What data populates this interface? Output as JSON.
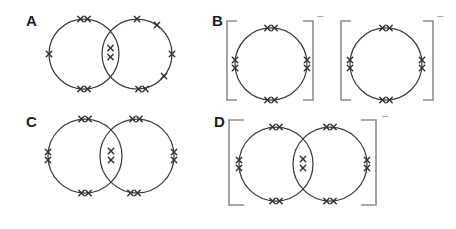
{
  "figure": {
    "palette": {
      "background": "#ffffff",
      "ink": "#3d3d3d",
      "mark_color": "#333333",
      "label_color": "#1c1c1c",
      "bracket_color": "#8e8e8e",
      "charge_color": "#9a9a9a"
    },
    "panels": [
      {
        "label": "A",
        "circles": [
          {
            "cx": 84,
            "cy": 54,
            "r": 35
          },
          {
            "cx": 137,
            "cy": 54,
            "r": 35
          }
        ],
        "marks": [
          {
            "x": 80.5,
            "y": 19
          },
          {
            "x": 87.5,
            "y": 19
          },
          {
            "x": 49,
            "y": 54
          },
          {
            "x": 80.5,
            "y": 89
          },
          {
            "x": 87.5,
            "y": 89
          },
          {
            "x": 110.5,
            "y": 48
          },
          {
            "x": 110.5,
            "y": 57
          },
          {
            "x": 137,
            "y": 19
          },
          {
            "x": 157,
            "y": 25
          },
          {
            "x": 172,
            "y": 54
          },
          {
            "x": 164,
            "y": 76
          },
          {
            "x": 138.5,
            "y": 89
          },
          {
            "x": 145.5,
            "y": 89
          }
        ],
        "brackets": [],
        "charges": []
      },
      {
        "label": "B",
        "circles": [
          {
            "cx": 271,
            "cy": 64,
            "r": 36
          },
          {
            "cx": 386,
            "cy": 64,
            "r": 36
          }
        ],
        "marks": [
          {
            "x": 267.5,
            "y": 28
          },
          {
            "x": 274.5,
            "y": 28
          },
          {
            "x": 267.5,
            "y": 100
          },
          {
            "x": 274.5,
            "y": 100
          },
          {
            "x": 235,
            "y": 60
          },
          {
            "x": 235,
            "y": 68
          },
          {
            "x": 307,
            "y": 60
          },
          {
            "x": 307,
            "y": 68
          },
          {
            "x": 382.5,
            "y": 28
          },
          {
            "x": 389.5,
            "y": 28
          },
          {
            "x": 382.5,
            "y": 100
          },
          {
            "x": 389.5,
            "y": 100
          },
          {
            "x": 350,
            "y": 60
          },
          {
            "x": 350,
            "y": 68
          },
          {
            "x": 422,
            "y": 60
          },
          {
            "x": 422,
            "y": 68
          }
        ],
        "brackets": [
          {
            "x": 227,
            "y1": 21,
            "y2": 100,
            "dir": "left",
            "arm": 10
          },
          {
            "x": 313,
            "y1": 21,
            "y2": 100,
            "dir": "right",
            "arm": 10
          },
          {
            "x": 341,
            "y1": 21,
            "y2": 100,
            "dir": "left",
            "arm": 10
          },
          {
            "x": 433,
            "y1": 21,
            "y2": 100,
            "dir": "right",
            "arm": 10
          }
        ],
        "charges": [
          {
            "x": 316,
            "y": 20,
            "symbol": "−"
          },
          {
            "x": 436,
            "y": 20,
            "symbol": "−"
          }
        ]
      },
      {
        "label": "C",
        "circles": [
          {
            "cx": 85,
            "cy": 156,
            "r": 37
          },
          {
            "cx": 137,
            "cy": 156,
            "r": 37
          }
        ],
        "marks": [
          {
            "x": 81.5,
            "y": 119
          },
          {
            "x": 88.5,
            "y": 119
          },
          {
            "x": 48,
            "y": 152
          },
          {
            "x": 48,
            "y": 160
          },
          {
            "x": 81.5,
            "y": 193
          },
          {
            "x": 88.5,
            "y": 193
          },
          {
            "x": 111,
            "y": 151
          },
          {
            "x": 111,
            "y": 160
          },
          {
            "x": 132.5,
            "y": 119
          },
          {
            "x": 139.5,
            "y": 119
          },
          {
            "x": 174,
            "y": 152
          },
          {
            "x": 174,
            "y": 160
          },
          {
            "x": 130.5,
            "y": 193
          },
          {
            "x": 137.5,
            "y": 193
          }
        ],
        "brackets": [],
        "charges": []
      },
      {
        "label": "D",
        "circles": [
          {
            "cx": 276,
            "cy": 164,
            "r": 37
          },
          {
            "cx": 330,
            "cy": 164,
            "r": 37
          }
        ],
        "marks": [
          {
            "x": 272.5,
            "y": 127
          },
          {
            "x": 279.5,
            "y": 127
          },
          {
            "x": 239,
            "y": 160
          },
          {
            "x": 239,
            "y": 168
          },
          {
            "x": 272.5,
            "y": 201
          },
          {
            "x": 279.5,
            "y": 201
          },
          {
            "x": 303,
            "y": 159
          },
          {
            "x": 303,
            "y": 168
          },
          {
            "x": 326.5,
            "y": 127
          },
          {
            "x": 333.5,
            "y": 127
          },
          {
            "x": 367,
            "y": 160
          },
          {
            "x": 367,
            "y": 168
          },
          {
            "x": 326.5,
            "y": 201
          },
          {
            "x": 333.5,
            "y": 201
          }
        ],
        "brackets": [
          {
            "x": 229,
            "y1": 120,
            "y2": 205,
            "dir": "left",
            "arm": 15
          },
          {
            "x": 376,
            "y1": 120,
            "y2": 205,
            "dir": "right",
            "arm": 15
          }
        ],
        "charges": [
          {
            "x": 381,
            "y": 120,
            "symbol": "−"
          }
        ]
      }
    ]
  }
}
